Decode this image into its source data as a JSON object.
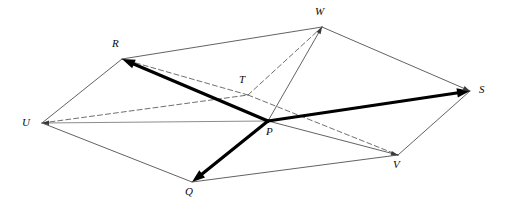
{
  "figure": {
    "type": "geometry-diagram",
    "width": 507,
    "height": 214,
    "background_color": "#ffffff"
  },
  "style": {
    "edge_color": "#3a3a3a",
    "edge_width": 0.8,
    "hidden_edge_color": "#4a4a4a",
    "hidden_edge_width": 0.8,
    "hidden_edge_dash": "5,3",
    "vector_color": "#000000",
    "vector_width": 3.2,
    "baseline_color": "#8d8d8d",
    "baseline_width": 1.0,
    "label_color": "#0a0a0a",
    "label_size": 11
  },
  "vertices": [
    {
      "id": "P",
      "label": "P",
      "x": 268,
      "y": 121,
      "label_x": 266,
      "label_y": 126
    },
    {
      "id": "Q",
      "label": "Q",
      "x": 192,
      "y": 182,
      "label_x": 185,
      "label_y": 186
    },
    {
      "id": "R",
      "label": "R",
      "x": 122,
      "y": 59,
      "label_x": 112,
      "label_y": 38
    },
    {
      "id": "S",
      "label": "S",
      "x": 470,
      "y": 91,
      "label_x": 479,
      "label_y": 84
    },
    {
      "id": "T",
      "label": "T",
      "x": 248,
      "y": 95,
      "label_x": 239,
      "label_y": 74
    },
    {
      "id": "U",
      "label": "U",
      "x": 42,
      "y": 123,
      "label_x": 22,
      "label_y": 117
    },
    {
      "id": "V",
      "label": "V",
      "x": 398,
      "y": 155,
      "label_x": 393,
      "label_y": 159
    },
    {
      "id": "W",
      "label": "W",
      "x": 322,
      "y": 27,
      "label_x": 315,
      "label_y": 6
    }
  ],
  "edges": [
    {
      "name": "edge-U-R",
      "from": "U",
      "to": "R",
      "kind": "solid"
    },
    {
      "name": "edge-R-W",
      "from": "R",
      "to": "W",
      "kind": "solid"
    },
    {
      "name": "edge-W-S",
      "from": "W",
      "to": "S",
      "kind": "solid"
    },
    {
      "name": "edge-S-V",
      "from": "S",
      "to": "V",
      "kind": "solid"
    },
    {
      "name": "edge-V-Q",
      "from": "V",
      "to": "Q",
      "kind": "solid"
    },
    {
      "name": "edge-Q-U",
      "from": "Q",
      "to": "U",
      "kind": "solid"
    },
    {
      "name": "edge-P-W",
      "from": "P",
      "to": "W",
      "kind": "solid"
    },
    {
      "name": "edge-P-V",
      "from": "P",
      "to": "V",
      "kind": "solid"
    },
    {
      "name": "edge-U-P",
      "from": "U",
      "to": "P",
      "kind": "baseline"
    },
    {
      "name": "edge-U-T",
      "from": "U",
      "to": "T",
      "kind": "dashed"
    },
    {
      "name": "edge-T-W",
      "from": "T",
      "to": "W",
      "kind": "dashed"
    },
    {
      "name": "edge-T-V",
      "from": "T",
      "to": "V",
      "kind": "dashed"
    },
    {
      "name": "edge-T-R",
      "from": "T",
      "to": "R",
      "kind": "dashed"
    }
  ],
  "vectors": [
    {
      "name": "vector-P-R",
      "from": "P",
      "to": "R",
      "label": ""
    },
    {
      "name": "vector-P-S",
      "from": "P",
      "to": "S",
      "label": ""
    },
    {
      "name": "vector-P-Q",
      "from": "P",
      "to": "Q",
      "label": ""
    }
  ],
  "arrow_tips": [
    {
      "name": "arrow-tip-W",
      "at": "W",
      "from": "P"
    },
    {
      "name": "arrow-tip-V",
      "at": "V",
      "from": "P"
    },
    {
      "name": "arrow-tip-U",
      "at": "U",
      "from": "P"
    },
    {
      "name": "arrow-tip-S-thin",
      "at": "S",
      "from": "W"
    }
  ]
}
